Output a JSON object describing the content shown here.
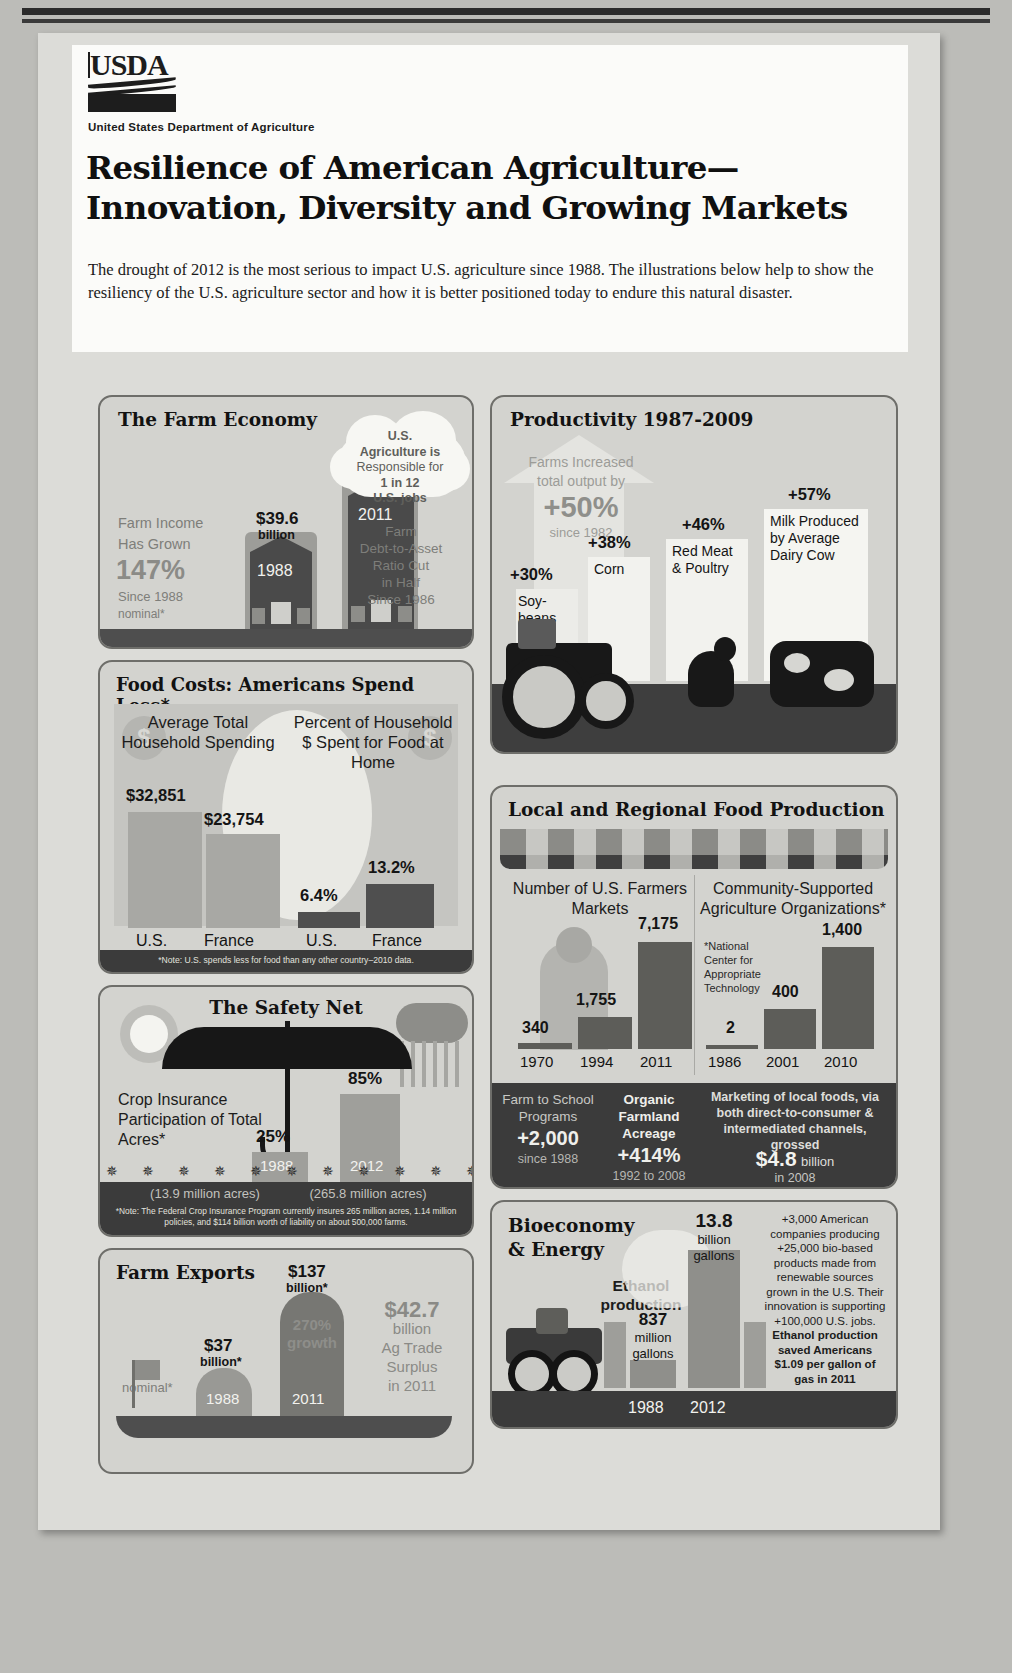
{
  "header": {
    "logo_text": "USDA",
    "agency": "United States Department of Agriculture",
    "title_line1": "Resilience of American Agriculture—",
    "title_line2": "Innovation, Diversity and Growing Markets",
    "subtitle": "The drought of 2012 is the most serious to impact U.S. agriculture since 1988. The illustrations below help to show the resiliency of the U.S. agriculture sector and how it is better positioned today to endure this natural disaster."
  },
  "colors": {
    "page_bg": "#bcbcb8",
    "sheet_bg": "#dcdcd8",
    "panel_bg": "#d3d3cf",
    "panel_border": "#6e6e6a",
    "dark_band": "#3b3b3b",
    "bar_dark": "#5a5a5a",
    "bar_light": "#9a9a96",
    "text_dark": "#141414",
    "text_light": "#f2f2ee"
  },
  "panels": {
    "farm_economy": {
      "title": "The Farm Economy",
      "left_text": {
        "line1": "Farm Income",
        "line2": "Has Grown",
        "big": "147%",
        "line3": "Since 1988",
        "line4": "nominal*"
      },
      "cloud": {
        "l1": "U.S.",
        "l2": "Agriculture is",
        "l3": "Responsible for",
        "l4": "1 in 12",
        "l5": "U.S. jobs"
      },
      "right_text": {
        "l1": "Farm",
        "l2": "Debt-to-Asset",
        "l3": "Ratio Cut",
        "l4": "in Half",
        "l5": "Since 1986"
      },
      "bars": [
        {
          "year": "1988",
          "value_top": "$39.6",
          "value_unit": "billion"
        },
        {
          "year": "2011",
          "value_top": "$98.1",
          "value_unit": "billion"
        }
      ]
    },
    "food_costs": {
      "title": "Food Costs: Americans Spend Less*",
      "group1": {
        "heading": "Average Total Household Spending",
        "values": [
          "$32,851",
          "$23,754"
        ],
        "labels": [
          "U.S.",
          "France"
        ]
      },
      "group2": {
        "heading": "Percent of Household $ Spent for Food at Home",
        "values": [
          "6.4%",
          "13.2%"
        ],
        "labels": [
          "U.S.",
          "France"
        ]
      },
      "note": "*Note: U.S. spends less for food than any other country–2010 data."
    },
    "safety_net": {
      "title": "The Safety Net",
      "left_text": "Crop Insurance Participation of Total Acres*",
      "bars": [
        {
          "value": "25%",
          "year": "1988",
          "sub": "(13.9 million acres)"
        },
        {
          "value": "85%",
          "year": "2012",
          "sub": "(265.8 million acres)"
        }
      ],
      "note": "*Note: The Federal Crop Insurance Program currently insures 265 million acres, 1.14 million policies, and $114 billion worth of liability on about 500,000 farms."
    },
    "farm_exports": {
      "title": "Farm Exports",
      "nominal": "nominal*",
      "bars": [
        {
          "value": "$37",
          "unit": "billion*",
          "year": "1988"
        },
        {
          "value": "$137",
          "unit": "billion*",
          "year": "2011"
        }
      ],
      "growth": "270% growth",
      "surplus": {
        "big": "$42.7",
        "l1": "billion",
        "l2": "Ag Trade",
        "l3": "Surplus",
        "l4": "in 2011"
      }
    },
    "productivity": {
      "title": "Productivity 1987-2009",
      "arrow_text": {
        "l1": "Farms Increased",
        "l2": "total output by",
        "big": "+50%",
        "l3": "since 1982"
      },
      "items": [
        {
          "pct": "+30%",
          "label": "Soy-beans"
        },
        {
          "pct": "+38%",
          "label": "Corn"
        },
        {
          "pct": "+46%",
          "label": "Red Meat & Poultry"
        },
        {
          "pct": "+57%",
          "label": "Milk Produced by Average Dairy Cow"
        }
      ]
    },
    "local_regional": {
      "title": "Local and Regional Food Production",
      "group1": {
        "heading": "Number of U.S. Farmers Markets",
        "values": [
          "340",
          "1,755",
          "7,175"
        ],
        "years": [
          "1970",
          "1994",
          "2011"
        ]
      },
      "group2": {
        "heading": "Community-Supported Agriculture Organizations*",
        "values": [
          "2",
          "400",
          "1,400"
        ],
        "years": [
          "1986",
          "2001",
          "2010"
        ],
        "footnote": "*National Center for Appropriate Technology"
      },
      "footer": [
        {
          "title": "Farm to School Programs",
          "big": "+2,000",
          "sub": "since 1988"
        },
        {
          "title": "Organic Farmland Acreage",
          "big": "+414%",
          "sub": "1992 to 2008"
        },
        {
          "text_pre": "Marketing of local foods, via both direct-to-consumer & intermediated channels, grossed",
          "big": "$4.8",
          "text_post": "billion",
          "sub": "in 2008"
        }
      ]
    },
    "bioeconomy": {
      "title": "Bioeconomy & Energy",
      "subject": "Ethanol production",
      "bars": [
        {
          "value": "837",
          "unit": "million gallons",
          "year": "1988"
        },
        {
          "value": "13.8",
          "unit": "billion gallons",
          "year": "2012"
        }
      ],
      "side_text_1": "+3,000 American companies producing +25,000 bio-based products made from renewable sources grown in the U.S. Their innovation is supporting +100,000 U.S. jobs.",
      "side_text_2": "Ethanol production saved Americans $1.09 per gallon of gas in 2011"
    }
  }
}
